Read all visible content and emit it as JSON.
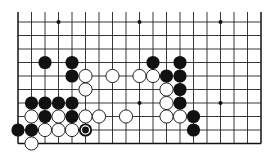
{
  "board": {
    "description": "Go board diagram (partial, bottom portion of 19x19)",
    "columns": 19,
    "visible_rows": 10,
    "origin_x": 18,
    "origin_y": 22,
    "spacing": 13.5,
    "top_extension": 10,
    "line_color": "#222222",
    "edge_color": "#111111",
    "stone_radius": 6.6,
    "hoshi": [
      [
        3,
        0
      ],
      [
        9,
        0
      ],
      [
        15,
        0
      ],
      [
        9,
        6
      ],
      [
        15,
        6
      ]
    ],
    "black_stones": [
      [
        2,
        3
      ],
      [
        4,
        3
      ],
      [
        10,
        3
      ],
      [
        12,
        3
      ],
      [
        4,
        4
      ],
      [
        11,
        4
      ],
      [
        12,
        4
      ],
      [
        12,
        5
      ],
      [
        1,
        6
      ],
      [
        2,
        6
      ],
      [
        3,
        6
      ],
      [
        4,
        6
      ],
      [
        12,
        6
      ],
      [
        2,
        7
      ],
      [
        4,
        7
      ],
      [
        13,
        7
      ],
      [
        0,
        8
      ],
      [
        1,
        8
      ],
      [
        13,
        8
      ]
    ],
    "white_stones": [
      [
        5,
        4
      ],
      [
        7,
        4
      ],
      [
        9,
        4
      ],
      [
        10,
        4
      ],
      [
        5,
        5
      ],
      [
        11,
        5
      ],
      [
        11,
        6
      ],
      [
        1,
        7
      ],
      [
        3,
        7
      ],
      [
        5,
        7
      ],
      [
        6,
        7
      ],
      [
        8,
        7
      ],
      [
        11,
        7
      ],
      [
        12,
        7
      ],
      [
        2,
        8
      ],
      [
        3,
        8
      ],
      [
        4,
        8
      ],
      [
        1,
        9
      ]
    ],
    "last_move": {
      "color": "black",
      "point": [
        5,
        8
      ],
      "marker": "circle"
    },
    "colors": {
      "black": "#111111",
      "white": "#ffffff",
      "white_outline": "#222222",
      "background": "#ffffff"
    }
  }
}
